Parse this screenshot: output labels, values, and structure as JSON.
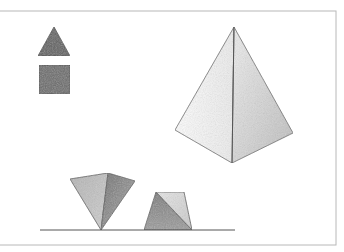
{
  "illustration": {
    "description": "Pencil-shaded geometric solids drawing",
    "frame": {
      "x": -2,
      "y": 11,
      "width": 338,
      "height": 234,
      "stroke": "#b8b8b8"
    },
    "colors": {
      "line": "#555555",
      "dark_fill": "#6a6a6a",
      "mid_fill": "#9a9a9a",
      "light_fill": "#c8c8c8",
      "pale_fill": "#ececec",
      "white_fill": "#fbfbfb"
    },
    "shapes": {
      "small_triangle": {
        "points": "54,27 38,56 70,56"
      },
      "small_square": {
        "x": 39,
        "y": 65,
        "width": 31,
        "height": 29
      },
      "pyramid": {
        "apex": "234,27",
        "left_face": "234,27 175,130 232,163",
        "right_face": "234,27 232,163 293,133"
      },
      "inverted_pyramid": {
        "left_face": "70,179 108,173 101,230",
        "right_face": "108,173 135,181 101,230"
      },
      "trapezoid": {
        "left_part": "156,192 144,230 192,230",
        "right_part": "156,192 184,192 192,230"
      },
      "ground_line": {
        "x1": 40,
        "y1": 230,
        "x2": 235,
        "y2": 230
      }
    }
  }
}
